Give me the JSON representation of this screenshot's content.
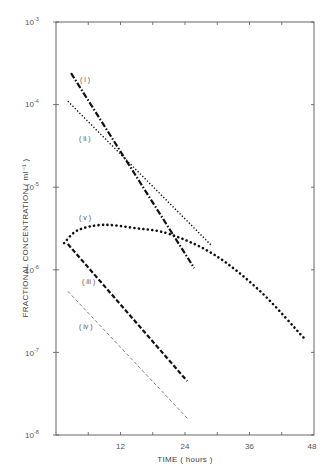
{
  "chart_data": {
    "type": "line",
    "title": "",
    "xlabel": "TIME ( hours )",
    "ylabel": "FRACTIONAL CONCENTRATION ( ml⁻¹ )",
    "xlim": [
      0,
      48
    ],
    "ylim": [
      1e-08,
      0.001
    ],
    "yscale": "log",
    "grid": false,
    "legend": "inline labels",
    "x_ticks": [
      12,
      24,
      36,
      48
    ],
    "x_minor_ticks": [
      6,
      18,
      30,
      42
    ],
    "y_ticks": [
      "10^-3",
      "10^-4",
      "10^-5",
      "10^-6",
      "10^-7",
      "10^-8"
    ],
    "series": [
      {
        "name": "( i )",
        "style": "dash-dot heavy",
        "x": [
          2.8,
          25.7
        ],
        "y": [
          0.00024,
          1.05e-06
        ]
      },
      {
        "name": "( ii )",
        "style": "dotted fine",
        "x": [
          2.2,
          29.0
        ],
        "y": [
          0.00011,
          1.95e-06
        ]
      },
      {
        "name": "( iii )",
        "style": "dashed heavy",
        "x": [
          2.2,
          24.4
        ],
        "y": [
          2.05e-06,
          4.5e-08
        ]
      },
      {
        "name": "( iv )",
        "style": "dashed thin",
        "x": [
          2.2,
          24.6
        ],
        "y": [
          5.5e-07,
          1.55e-08
        ]
      },
      {
        "name": "( v )",
        "style": "dotted heavy",
        "x": [
          1.5,
          4,
          8.7,
          14.7,
          21.2,
          29.6,
          38,
          46.1
        ],
        "y": [
          2.1e-06,
          3e-06,
          3.5e-06,
          3.2e-06,
          2.7e-06,
          1.5e-06,
          5.5e-07,
          1.5e-07
        ]
      }
    ]
  },
  "labels": {
    "x_axis": "TIME ( hours )",
    "y_axis": "FRACTIONAL CONCENTRATION ( ml⁻¹ )",
    "x_ticks": [
      "12",
      "24",
      "36",
      "48"
    ],
    "y_ticks": [
      {
        "base": "10",
        "exp": "-3"
      },
      {
        "base": "10",
        "exp": "-4"
      },
      {
        "base": "10",
        "exp": "-5"
      },
      {
        "base": "10",
        "exp": "-6"
      },
      {
        "base": "10",
        "exp": "-7"
      },
      {
        "base": "10",
        "exp": "-8"
      }
    ],
    "curves": [
      "( i )",
      "( ii )",
      "( iii )",
      "( iv )",
      "( v )"
    ]
  }
}
